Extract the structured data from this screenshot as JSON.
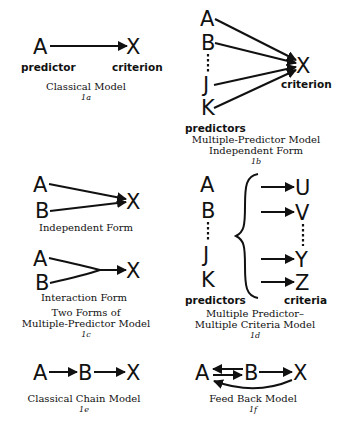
{
  "figure": {
    "panels": [
      {
        "id": "1a",
        "nodes": {
          "predictor": "A",
          "criterion": "X"
        },
        "labels": {
          "left": "predictor",
          "right": "criterion"
        },
        "caption": [
          "Classical Model"
        ],
        "number": "1a"
      },
      {
        "id": "1b",
        "nodes": {
          "predictors": [
            "A",
            "B",
            "J",
            "K"
          ],
          "criterion": "X"
        },
        "labels": {
          "predictors": "predictors",
          "criterion": "criterion"
        },
        "caption": [
          "Multiple-Predictor Model",
          "Independent Form"
        ],
        "number": "1b"
      },
      {
        "id": "1c",
        "subpanels": [
          {
            "nodes": {
              "a": "A",
              "b": "B",
              "x": "X"
            },
            "label": "Independent Form"
          },
          {
            "nodes": {
              "a": "A",
              "b": "B",
              "x": "X"
            },
            "label": "Interaction Form"
          }
        ],
        "caption": [
          "Two Forms of",
          "Multiple-Predictor Model"
        ],
        "number": "1c"
      },
      {
        "id": "1d",
        "nodes": {
          "predictors": [
            "A",
            "B",
            "J",
            "K"
          ],
          "criteria": [
            "U",
            "V",
            "Y",
            "Z"
          ]
        },
        "labels": {
          "predictors": "predictors",
          "criteria": "criteria"
        },
        "caption": [
          "Multiple Predictor–",
          "Multiple Criteria Model"
        ],
        "number": "1d"
      },
      {
        "id": "1e",
        "nodes": [
          "A",
          "B",
          "X"
        ],
        "caption": [
          "Classical Chain Model"
        ],
        "number": "1e"
      },
      {
        "id": "1f",
        "nodes": [
          "A",
          "B",
          "X"
        ],
        "caption": [
          "Feed Back Model"
        ],
        "number": "1f"
      }
    ]
  }
}
